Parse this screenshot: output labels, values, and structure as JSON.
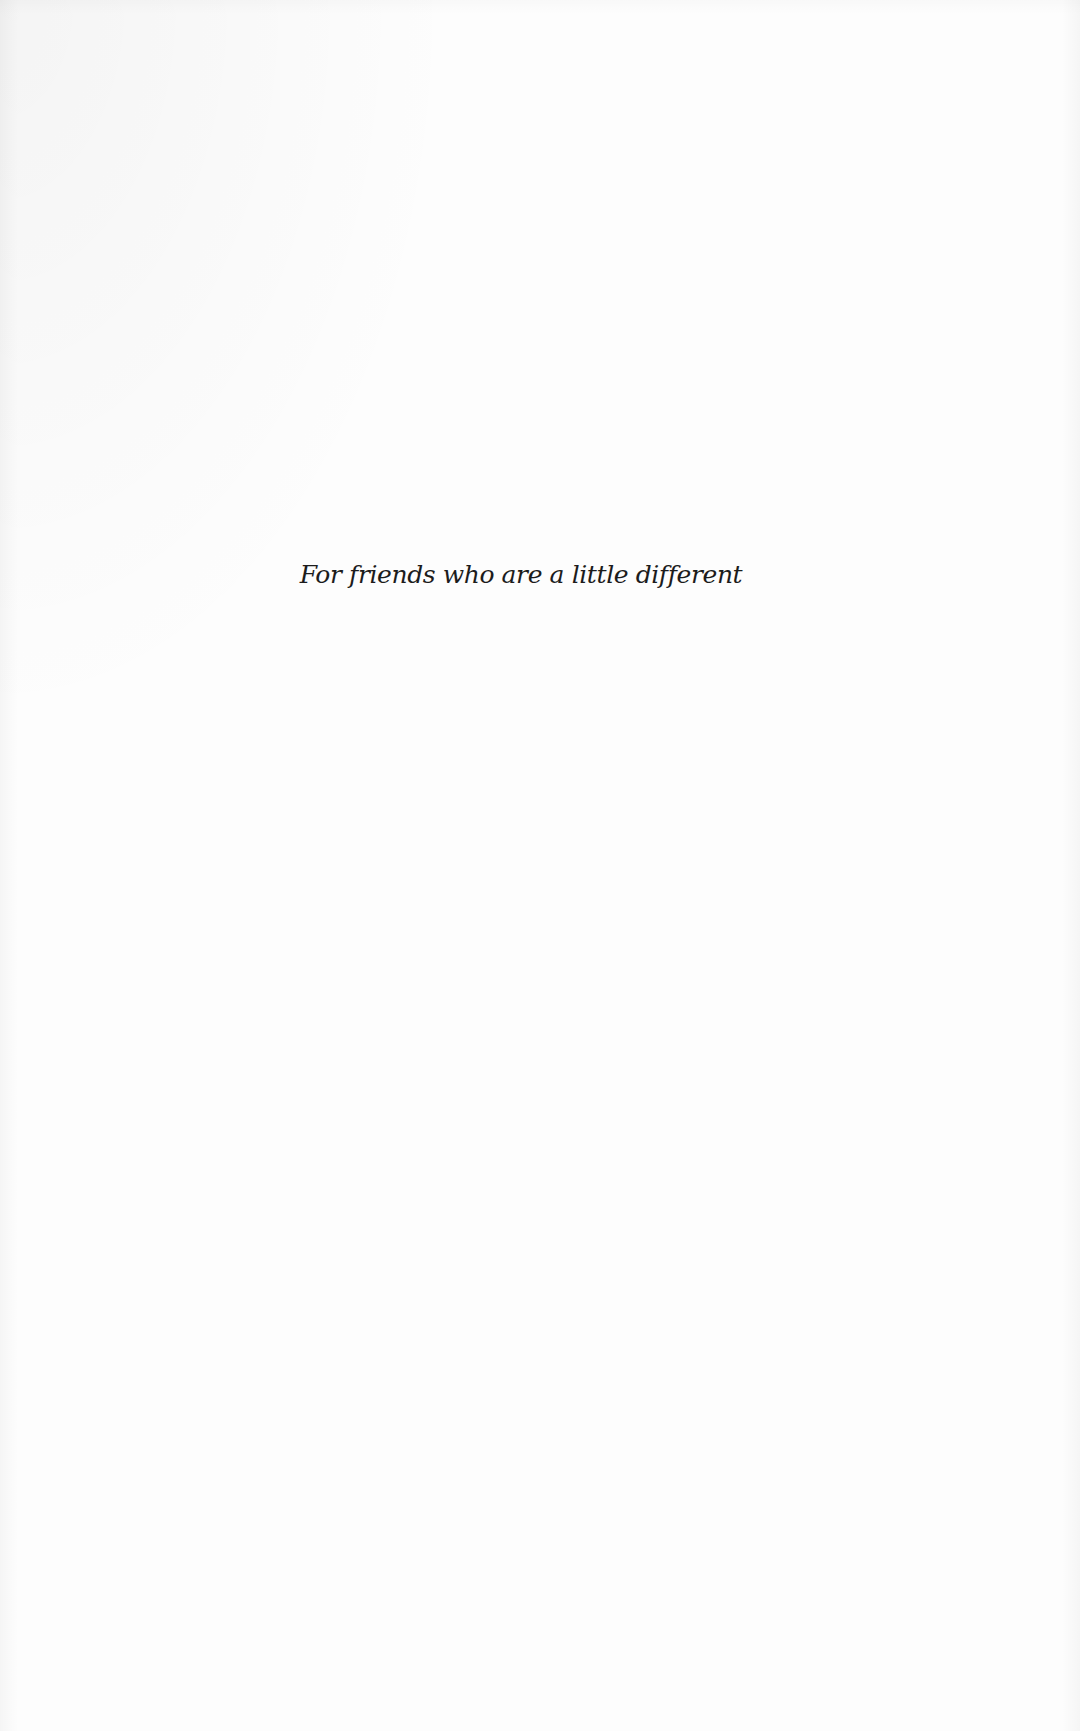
{
  "page": {
    "dedication": "For friends who are a little different"
  }
}
